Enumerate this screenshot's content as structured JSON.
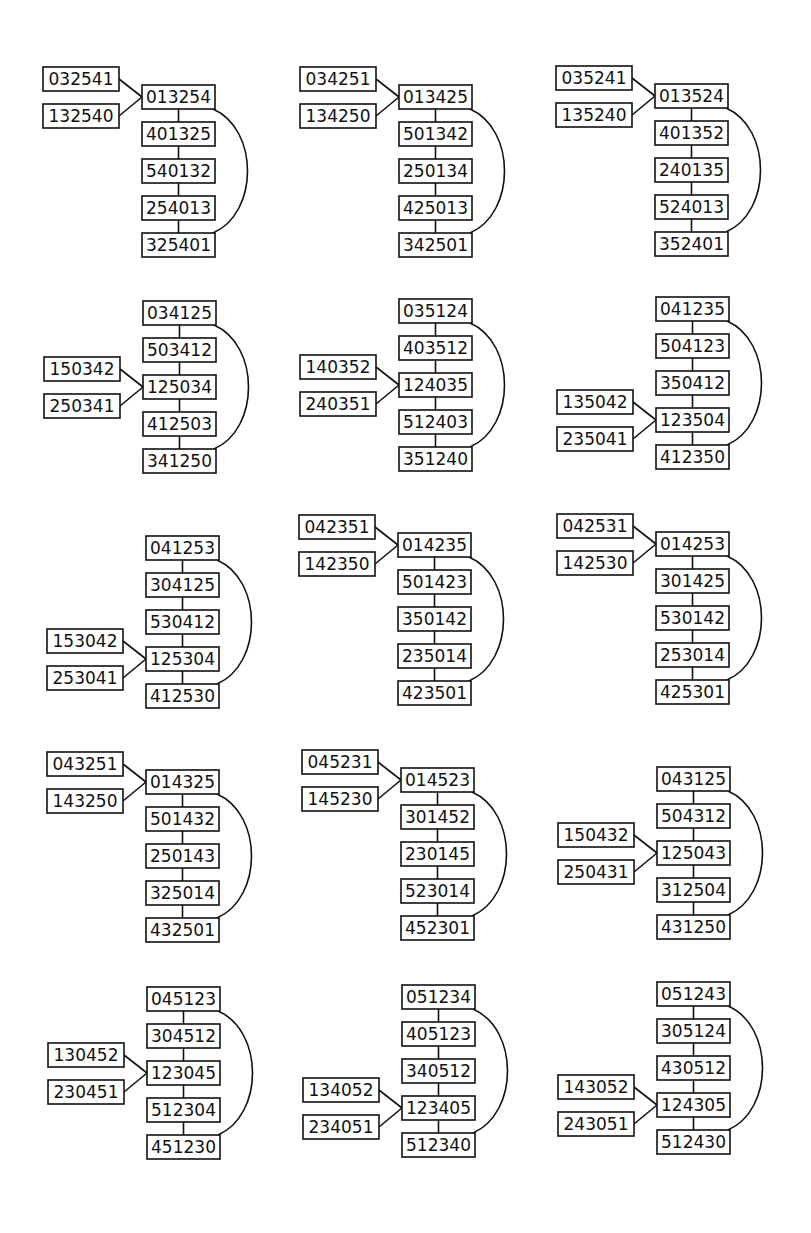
{
  "layout": {
    "box_width": 73,
    "box_height": 24,
    "pitch": 37,
    "side_box_width": 76,
    "side_offset_x": 100
  },
  "colors": {
    "stroke": "#111111",
    "fill": "#ffffff",
    "text": "#111111"
  },
  "diagrams": [
    {
      "id": "d1",
      "x": 142,
      "y": 85,
      "chain": [
        "013254",
        "401325",
        "540132",
        "254013",
        "325401"
      ],
      "attach": 0,
      "side": [
        "032541",
        "132540"
      ]
    },
    {
      "id": "d2",
      "x": 399,
      "y": 85,
      "chain": [
        "013425",
        "501342",
        "250134",
        "425013",
        "342501"
      ],
      "attach": 0,
      "side": [
        "034251",
        "134250"
      ]
    },
    {
      "id": "d3",
      "x": 655,
      "y": 84,
      "chain": [
        "013524",
        "401352",
        "240135",
        "524013",
        "352401"
      ],
      "attach": 0,
      "side": [
        "035241",
        "135240"
      ]
    },
    {
      "id": "d4",
      "x": 143,
      "y": 301,
      "chain": [
        "034125",
        "503412",
        "125034",
        "412503",
        "341250"
      ],
      "attach": 2,
      "side": [
        "150342",
        "250341"
      ]
    },
    {
      "id": "d5",
      "x": 399,
      "y": 299,
      "chain": [
        "035124",
        "403512",
        "124035",
        "512403",
        "351240"
      ],
      "attach": 2,
      "side": [
        "140352",
        "240351"
      ]
    },
    {
      "id": "d6",
      "x": 656,
      "y": 297,
      "chain": [
        "041235",
        "504123",
        "350412",
        "123504",
        "412350"
      ],
      "attach": 3,
      "side": [
        "135042",
        "235041"
      ]
    },
    {
      "id": "d7",
      "x": 146,
      "y": 536,
      "chain": [
        "041253",
        "304125",
        "530412",
        "125304",
        "412530"
      ],
      "attach": 3,
      "side": [
        "153042",
        "253041"
      ]
    },
    {
      "id": "d8",
      "x": 398,
      "y": 533,
      "chain": [
        "014235",
        "501423",
        "350142",
        "235014",
        "423501"
      ],
      "attach": 0,
      "side": [
        "042351",
        "142350"
      ]
    },
    {
      "id": "d9",
      "x": 656,
      "y": 532,
      "chain": [
        "014253",
        "301425",
        "530142",
        "253014",
        "425301"
      ],
      "attach": 0,
      "side": [
        "042531",
        "142530"
      ]
    },
    {
      "id": "d10",
      "x": 146,
      "y": 770,
      "chain": [
        "014325",
        "501432",
        "250143",
        "325014",
        "432501"
      ],
      "attach": 0,
      "side": [
        "043251",
        "143250"
      ]
    },
    {
      "id": "d11",
      "x": 401,
      "y": 768,
      "chain": [
        "014523",
        "301452",
        "230145",
        "523014",
        "452301"
      ],
      "attach": 0,
      "side": [
        "045231",
        "145230"
      ]
    },
    {
      "id": "d12",
      "x": 657,
      "y": 767,
      "chain": [
        "043125",
        "504312",
        "125043",
        "312504",
        "431250"
      ],
      "attach": 2,
      "side": [
        "150432",
        "250431"
      ]
    },
    {
      "id": "d13",
      "x": 147,
      "y": 987,
      "chain": [
        "045123",
        "304512",
        "123045",
        "512304",
        "451230"
      ],
      "attach": 2,
      "side": [
        "130452",
        "230451"
      ]
    },
    {
      "id": "d14",
      "x": 402,
      "y": 985,
      "chain": [
        "051234",
        "405123",
        "340512",
        "123405",
        "512340"
      ],
      "attach": 3,
      "side": [
        "134052",
        "234051"
      ]
    },
    {
      "id": "d15",
      "x": 657,
      "y": 982,
      "chain": [
        "051243",
        "305124",
        "430512",
        "124305",
        "512430"
      ],
      "attach": 3,
      "side": [
        "143052",
        "243051"
      ]
    }
  ]
}
